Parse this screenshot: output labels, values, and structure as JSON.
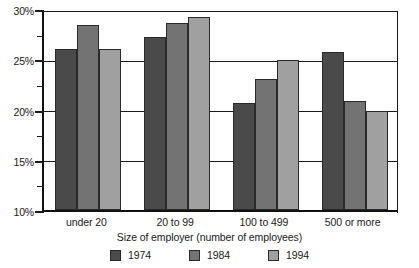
{
  "chart_data": {
    "type": "bar",
    "title": "",
    "subtitle": "",
    "xlabel": "Size of employer (number of employees)",
    "ylabel": "",
    "categories": [
      "under 20",
      "20 to 99",
      "100 to 499",
      "500 or more"
    ],
    "series": [
      {
        "name": "1974",
        "color": "#4a4a4a",
        "values": [
          26.0,
          27.2,
          20.6,
          25.7
        ]
      },
      {
        "name": "1984",
        "color": "#737373",
        "values": [
          28.4,
          28.6,
          23.0,
          20.8
        ]
      },
      {
        "name": "1994",
        "color": "#a0a0a0",
        "values": [
          26.0,
          29.2,
          24.9,
          19.9
        ]
      }
    ],
    "ylim": [
      10,
      30
    ],
    "yticks": [
      10,
      15,
      20,
      25,
      30
    ],
    "ytick_labels": [
      "10%",
      "15%",
      "20%",
      "25%",
      "30%"
    ],
    "yminor_ticks": [
      12.5,
      17.5,
      22.5,
      27.5
    ],
    "grid": true,
    "grid_axis": "y",
    "legend_position": "bottom",
    "value_format": "percent"
  }
}
